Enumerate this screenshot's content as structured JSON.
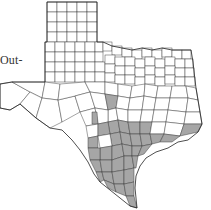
{
  "map": {
    "subject": "Texas counties",
    "partial_label": "Out-",
    "colors": {
      "background": "#ffffff",
      "unshaded": "#ffffff",
      "shaded": "#a6a6a6",
      "border": "#333333"
    },
    "shaded_region": "South Texas and Gulf Coast counties"
  }
}
